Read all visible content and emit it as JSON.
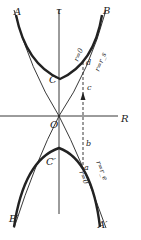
{
  "diagram": {
    "axes": {
      "vertical_label": "τ",
      "horizontal_label": "R"
    },
    "points": {
      "A": "A",
      "B": "B",
      "A_prime": "A′",
      "B_prime": "B′",
      "C": "C",
      "C_prime": "C′",
      "O": "O",
      "a": "a",
      "b": "b",
      "c": "c",
      "d": "d"
    },
    "curve_labels": {
      "upper_r0": "r=0",
      "upper_rs": "r=r_s",
      "lower_r0": "r=0",
      "lower_re": "r=r_e"
    },
    "colors": {
      "ink": "#222222",
      "background": "#ffffff"
    }
  }
}
